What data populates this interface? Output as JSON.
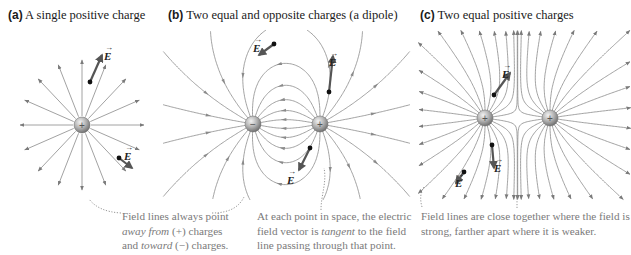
{
  "panels": [
    {
      "id": "a",
      "letter": "(a)",
      "title": "A single positive charge",
      "charges": [
        {
          "sign": "+",
          "x": 82,
          "y": 125
        }
      ]
    },
    {
      "id": "b",
      "letter": "(b)",
      "title": "Two equal and opposite charges (a dipole)",
      "charges": [
        {
          "sign": "−",
          "x": 253,
          "y": 124
        },
        {
          "sign": "+",
          "x": 320,
          "y": 124
        }
      ]
    },
    {
      "id": "c",
      "letter": "(c)",
      "title": "Two equal positive charges",
      "charges": [
        {
          "sign": "+",
          "x": 485,
          "y": 118
        },
        {
          "sign": "+",
          "x": 550,
          "y": 118
        }
      ]
    }
  ],
  "vector_label": "E",
  "vector_arrow_glyph": "→",
  "captions": {
    "a": {
      "line1": "Field lines always point",
      "line2_italic": "away from",
      "line2_rest": " (+) charges",
      "line3_pre": "and ",
      "line3_italic": "toward",
      "line3_rest": " (−) charges."
    },
    "b": {
      "line1": "At each point in space, the electric",
      "line2_pre": "field vector is ",
      "line2_italic": "tangent",
      "line2_rest": " to the field",
      "line3": "line passing through that point."
    },
    "c": {
      "line1": "Field lines are close together where the field is",
      "line2": "strong, farther apart where it is weaker."
    }
  },
  "colors": {
    "field_line": "#8a8a8a",
    "vector": "#555555",
    "caption_text": "#7a7a7a",
    "leader_dots": "#8a8a8a",
    "charge_fill_light": "#e8e8e8",
    "charge_fill_dark": "#8c8c8c"
  }
}
